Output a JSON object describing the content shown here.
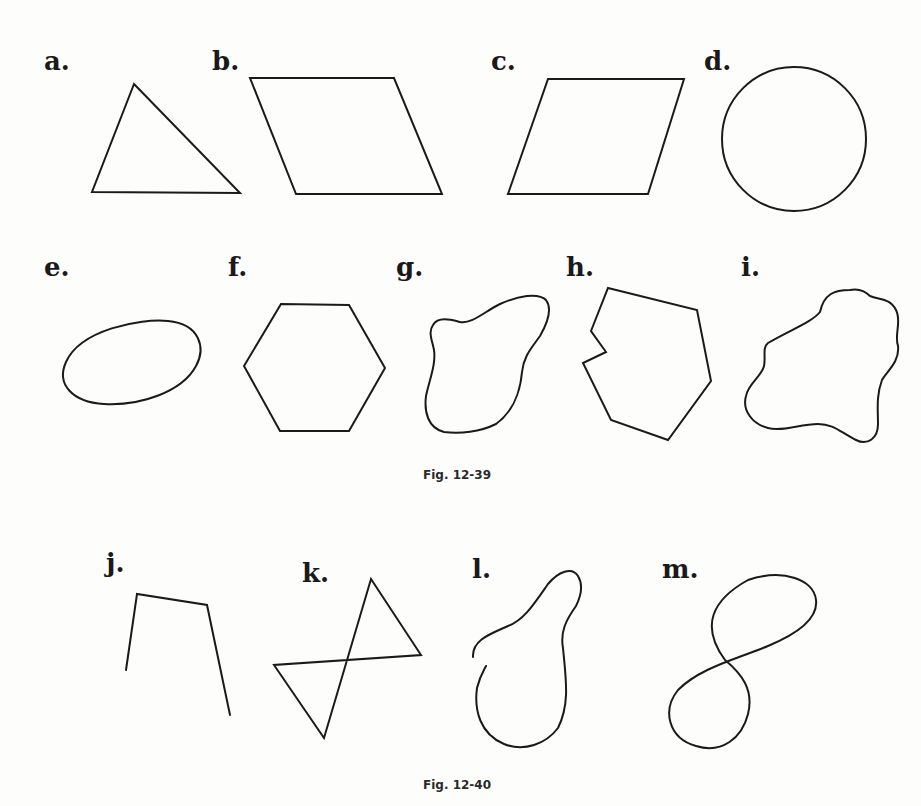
{
  "figures": [
    {
      "caption": "Fig. 12-39",
      "shapes": [
        {
          "label": "a.",
          "kind": "triangle"
        },
        {
          "label": "b.",
          "kind": "parallelogram"
        },
        {
          "label": "c.",
          "kind": "parallelogram"
        },
        {
          "label": "d.",
          "kind": "circle"
        },
        {
          "label": "e.",
          "kind": "oval closed curve"
        },
        {
          "label": "f.",
          "kind": "hexagon"
        },
        {
          "label": "g.",
          "kind": "irregular closed curve"
        },
        {
          "label": "h.",
          "kind": "concave polygon"
        },
        {
          "label": "i.",
          "kind": "irregular closed curve"
        }
      ]
    },
    {
      "caption": "Fig. 12-40",
      "shapes": [
        {
          "label": "j.",
          "kind": "open polygonal path"
        },
        {
          "label": "k.",
          "kind": "self-intersecting polygon (bowtie)"
        },
        {
          "label": "l.",
          "kind": "open curve"
        },
        {
          "label": "m.",
          "kind": "self-intersecting closed curve (figure eight)"
        }
      ]
    }
  ],
  "colors": {
    "stroke": "#1a1a1a",
    "background": "#fdfdfc"
  }
}
